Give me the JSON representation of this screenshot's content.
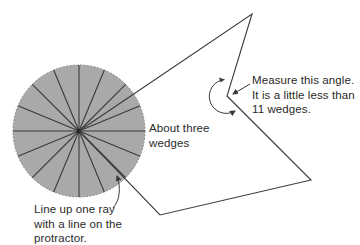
{
  "diagram": {
    "type": "protractor-angle-measurement",
    "protractor": {
      "center": [
        79,
        131
      ],
      "radius": 66,
      "wedge_count": 16,
      "fill_color": "#a9a9a9",
      "line_color": "#3a3a3a"
    },
    "figure": {
      "line_color": "#3a3a3a",
      "vertices": {
        "top": [
          252,
          14
        ],
        "reflex_vertex": [
          227,
          96
        ],
        "right": [
          311,
          180
        ],
        "bottom": [
          160,
          215
        ],
        "protractor_center": [
          79,
          131
        ]
      }
    },
    "angle_arc": {
      "center": [
        227,
        96
      ],
      "radius": 17
    }
  },
  "labels": {
    "about_three": {
      "lines": [
        "About three",
        "wedges"
      ]
    },
    "measure": {
      "lines": [
        "Measure this angle.",
        "It is a little less than",
        "11 wedges."
      ]
    },
    "line_up": {
      "lines": [
        "Line up one ray",
        "with a line on the",
        "protractor."
      ]
    }
  },
  "colors": {
    "ink": "#3a3a3a",
    "protractor_fill": "#a9a9a9",
    "text": "#2a2a2a",
    "background": "#ffffff"
  }
}
